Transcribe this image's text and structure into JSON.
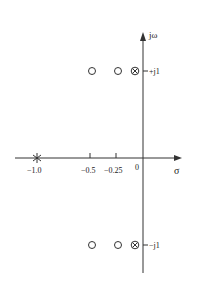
{
  "diagram": {
    "type": "s-plane pole-zero plot",
    "axes": {
      "real_label": "σ",
      "imag_label": "jω",
      "origin_label": "0"
    },
    "real_ticks": [
      {
        "value": -1.0,
        "label": "−1.0"
      },
      {
        "value": -0.5,
        "label": "−0.5"
      },
      {
        "value": -0.25,
        "label": "−0.25"
      }
    ],
    "imag_ticks": [
      {
        "value": 1,
        "label": "+j1"
      },
      {
        "value": -1,
        "label": "−j1"
      }
    ],
    "zeros": [
      {
        "re": -0.5,
        "im": 1
      },
      {
        "re": -0.25,
        "im": 1
      },
      {
        "re": -0.5,
        "im": -1
      },
      {
        "re": -0.25,
        "im": -1
      }
    ],
    "pole_zero_coincident": [
      {
        "re": -0.05,
        "im": 1,
        "symbol": "⊗"
      },
      {
        "re": -0.05,
        "im": -1,
        "symbol": "⊗"
      }
    ],
    "poles": [
      {
        "re": -1.0,
        "im": 0,
        "symbol": "✳"
      }
    ]
  }
}
